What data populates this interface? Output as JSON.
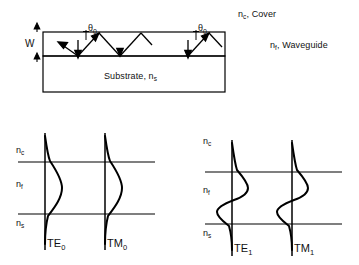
{
  "figure": {
    "title_hidden": "",
    "type": "optical-waveguide-mode-diagram",
    "stroke_color": "#000000",
    "background": "#ffffff"
  },
  "cross_section": {
    "name": "slab-waveguide-cross-section",
    "labels": {
      "cover": "n",
      "cover_sub": "c",
      "cover_text": ", Cover",
      "waveguide": "n",
      "waveguide_sub": "f",
      "waveguide_text": ", Waveguide",
      "substrate_text": "Substrate, n",
      "substrate_sub": "s",
      "thickness": "W",
      "angle": "θ",
      "angle_sub": "0"
    },
    "angle_count": 2,
    "ray": "zigzag total-internal-reflection ray path"
  },
  "mode_panels": [
    {
      "name": "fundamental-modes-panel",
      "order": 0,
      "region_labels": [
        {
          "symbol": "n",
          "sub": "c"
        },
        {
          "symbol": "n",
          "sub": "f"
        },
        {
          "symbol": "n",
          "sub": "s"
        }
      ],
      "modes": [
        {
          "label": "TE",
          "sub": "0",
          "nodes": 0,
          "shape": "single-lobe"
        },
        {
          "label": "TM",
          "sub": "0",
          "nodes": 0,
          "shape": "single-lobe"
        }
      ]
    },
    {
      "name": "first-order-modes-panel",
      "order": 1,
      "region_labels": [
        {
          "symbol": "n",
          "sub": "c"
        },
        {
          "symbol": "n",
          "sub": "f"
        },
        {
          "symbol": "n",
          "sub": "s"
        }
      ],
      "modes": [
        {
          "label": "TE",
          "sub": "1",
          "nodes": 1,
          "shape": "two-lobe-antisymmetric"
        },
        {
          "label": "TM",
          "sub": "1",
          "nodes": 1,
          "shape": "two-lobe-antisymmetric"
        }
      ]
    }
  ]
}
